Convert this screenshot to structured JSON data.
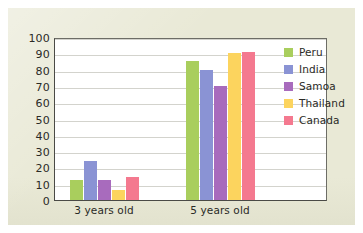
{
  "chart_data": {
    "type": "bar",
    "title": "",
    "subtitle": "",
    "xlabel": "",
    "ylabel": "",
    "categories": [
      "3 years old",
      "5 years old"
    ],
    "series": [
      {
        "name": "Peru",
        "values": [
          12,
          85
        ],
        "color": "#a9ce5d"
      },
      {
        "name": "India",
        "values": [
          24,
          80
        ],
        "color": "#8a93d4"
      },
      {
        "name": "Samoa",
        "values": [
          12,
          70
        ],
        "color": "#a86bbd"
      },
      {
        "name": "Thailand",
        "values": [
          6,
          90
        ],
        "color": "#fcd45e"
      },
      {
        "name": "Canada",
        "values": [
          14,
          91
        ],
        "color": "#f4798f"
      }
    ],
    "ylim": [
      0,
      100
    ],
    "yticks": [
      100,
      90,
      80,
      70,
      60,
      50,
      40,
      30,
      20,
      10,
      0
    ],
    "grid": true,
    "legend_position": "right-inside-top"
  },
  "figure": {
    "panel_color": "#e9e9d6",
    "plot_background": "#ffffff",
    "gridline_color": "#d3d3cd",
    "axis_color": "#4a4a46",
    "text_color": "#2a2a26"
  }
}
